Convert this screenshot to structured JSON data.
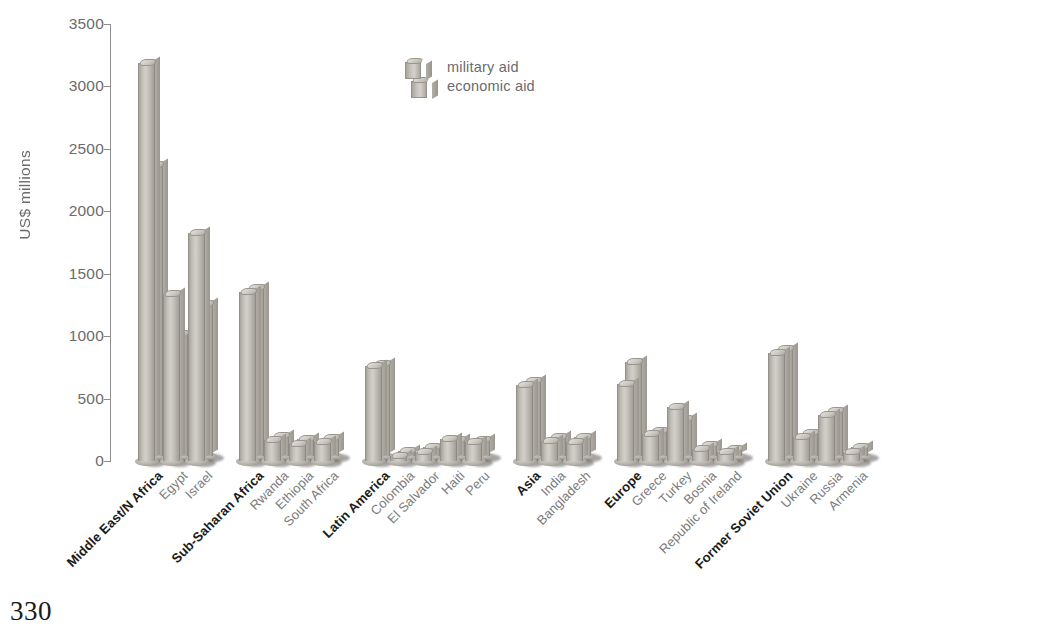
{
  "page": {
    "number": "330"
  },
  "legend": {
    "items": [
      {
        "key": "military",
        "label": "military aid"
      },
      {
        "key": "economic",
        "label": "economic aid"
      }
    ]
  },
  "chart_data": {
    "type": "bar",
    "title": "",
    "subtitle": "",
    "xlabel": "",
    "ylabel": "US$ millions",
    "ylim": [
      0,
      3500
    ],
    "yticks": [
      0,
      500,
      1000,
      1500,
      2000,
      2500,
      3000,
      3500
    ],
    "ytick_labels": [
      "0",
      "500",
      "1000",
      "1500",
      "2000",
      "2500",
      "3000",
      "3500"
    ],
    "grid": false,
    "legend_position": "top-center",
    "series": [
      {
        "name": "military aid",
        "color": "#bdb9b3"
      },
      {
        "name": "economic aid",
        "color": "#bdb9b3"
      }
    ],
    "groups": [
      {
        "region": "Middle East/N Africa",
        "bars": [
          {
            "label": "Middle East/N Africa",
            "bold": true,
            "military": 3190,
            "economic": 2330
          },
          {
            "label": "Egypt",
            "bold": false,
            "military": 1340,
            "economic": 980
          },
          {
            "label": "Israel",
            "bold": false,
            "military": 1830,
            "economic": 1215
          }
        ]
      },
      {
        "region": "Sub-Saharan Africa",
        "bars": [
          {
            "label": "Sub-Saharan Africa",
            "bold": true,
            "military": 1350,
            "economic": 1345
          },
          {
            "label": "Rwanda",
            "bold": false,
            "military": 165,
            "economic": 160
          },
          {
            "label": "Ethiopia",
            "bold": false,
            "military": 140,
            "economic": 135
          },
          {
            "label": "South Africa",
            "bold": false,
            "military": 150,
            "economic": 145
          }
        ]
      },
      {
        "region": "Latin America",
        "bars": [
          {
            "label": "Latin America",
            "bold": true,
            "military": 760,
            "economic": 735
          },
          {
            "label": "Colombia",
            "bold": false,
            "military": 30,
            "economic": 25
          },
          {
            "label": "El Salvador",
            "bold": false,
            "military": 75,
            "economic": 70
          },
          {
            "label": "Haiti",
            "bold": false,
            "military": 175,
            "economic": 130
          },
          {
            "label": "Peru",
            "bold": false,
            "military": 150,
            "economic": 125
          }
        ]
      },
      {
        "region": "Asia",
        "bars": [
          {
            "label": "Asia",
            "bold": true,
            "military": 610,
            "economic": 600
          },
          {
            "label": "India",
            "bold": false,
            "military": 160,
            "economic": 155
          },
          {
            "label": "Bangladesh",
            "bold": false,
            "military": 155,
            "economic": 150
          }
        ]
      },
      {
        "region": "Europe",
        "bars": [
          {
            "label": "Europe",
            "bold": true,
            "military": 620,
            "economic": 750
          },
          {
            "label": "Greece",
            "bold": false,
            "military": 215,
            "economic": 200
          },
          {
            "label": "Turkey",
            "bold": false,
            "military": 435,
            "economic": 295
          },
          {
            "label": "Bosnia",
            "bold": false,
            "military": 95,
            "economic": 85
          },
          {
            "label": "Republic of Ireland",
            "bold": false,
            "military": 70,
            "economic": 60
          }
        ]
      },
      {
        "region": "Former Soviet Union",
        "bars": [
          {
            "label": "Former Soviet Union",
            "bold": true,
            "military": 865,
            "economic": 855
          },
          {
            "label": "Ukraine",
            "bold": false,
            "military": 190,
            "economic": 185
          },
          {
            "label": "Russia",
            "bold": false,
            "military": 370,
            "economic": 360
          },
          {
            "label": "Armenia",
            "bold": false,
            "military": 75,
            "economic": 70
          }
        ]
      }
    ]
  }
}
